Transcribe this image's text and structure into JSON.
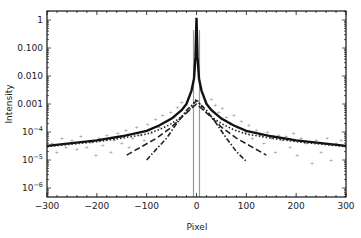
{
  "chart_data": {
    "type": "line",
    "title": "",
    "xlabel": "Pixel",
    "ylabel": "Intensity",
    "xlim": [
      -300,
      300
    ],
    "ylim": [
      4.8e-07,
      2.1
    ],
    "yscale": "log",
    "grid": false,
    "legend": null,
    "x_ticks": [
      -300,
      -200,
      -100,
      0,
      100,
      200,
      300
    ],
    "x_tick_labels": [
      "-300",
      "-200",
      "-100",
      "0",
      "100",
      "200",
      "300"
    ],
    "y_ticks": [
      1,
      0.1,
      0.01,
      0.001,
      0.0001,
      1e-05,
      1e-06
    ],
    "y_tick_labels": [
      "1",
      "0.100",
      "0.010",
      "0.001",
      "10^-4",
      "10^-5",
      "10^-6"
    ],
    "series": [
      {
        "name": "total fit",
        "style": "solid-thick",
        "color": "#111111",
        "x": [
          -300,
          -250,
          -200,
          -150,
          -100,
          -75,
          -50,
          -30,
          -20,
          -10,
          -5,
          -2,
          0,
          2,
          5,
          10,
          20,
          30,
          50,
          75,
          100,
          150,
          200,
          250,
          300
        ],
        "y": [
          3.2e-05,
          4e-05,
          5e-05,
          7e-05,
          0.00011,
          0.00017,
          0.0003,
          0.0006,
          0.001,
          0.003,
          0.008,
          0.05,
          1.2,
          0.05,
          0.008,
          0.003,
          0.001,
          0.0006,
          0.0003,
          0.00017,
          0.00011,
          7e-05,
          5e-05,
          4e-05,
          3.2e-05
        ]
      },
      {
        "name": "component 1 (dotted)",
        "style": "dotted",
        "color": "#222222",
        "x": [
          -300,
          -200,
          -150,
          -100,
          -75,
          -50,
          -30,
          -15,
          0,
          15,
          30,
          50,
          75,
          100,
          150,
          200,
          300
        ],
        "y": [
          3e-05,
          4.5e-05,
          6e-05,
          8.5e-05,
          0.00012,
          0.0002,
          0.00035,
          0.0006,
          0.0015,
          0.0006,
          0.00035,
          0.0002,
          0.00012,
          8.5e-05,
          6e-05,
          4.5e-05,
          3e-05
        ]
      },
      {
        "name": "component 2 (dash-dot)",
        "style": "dash-dot",
        "color": "#222222",
        "x": [
          -100,
          -80,
          -60,
          -40,
          -20,
          0,
          20,
          40,
          60,
          80,
          100
        ],
        "y": [
          1e-05,
          2.5e-05,
          6e-05,
          0.0002,
          0.0006,
          0.0013,
          0.0006,
          0.0002,
          6e-05,
          2e-05,
          9e-06
        ]
      },
      {
        "name": "component 3 (long dash)",
        "style": "long-dash",
        "color": "#222222",
        "x": [
          -140,
          -110,
          -80,
          -50,
          -25,
          0,
          25,
          50,
          80,
          110,
          140
        ],
        "y": [
          1.5e-05,
          3e-05,
          6e-05,
          0.00015,
          0.0004,
          0.001,
          0.0004,
          0.00015,
          6e-05,
          3e-05,
          1.5e-05
        ]
      },
      {
        "name": "data points",
        "style": "scatter",
        "color": "#8a8a8a",
        "x": [
          -290,
          -280,
          -270,
          -262,
          -250,
          -240,
          -232,
          -220,
          -210,
          -202,
          -195,
          -188,
          -180,
          -172,
          -165,
          -158,
          -150,
          -142,
          -135,
          -128,
          -120,
          -112,
          -105,
          -98,
          -90,
          -82,
          -75,
          -68,
          -60,
          -52,
          -45,
          -38,
          -30,
          30,
          38,
          45,
          52,
          60,
          68,
          75,
          82,
          90,
          98,
          105,
          112,
          120,
          128,
          135,
          142,
          150,
          158,
          165,
          172,
          180,
          188,
          195,
          202,
          210,
          220,
          232,
          240,
          250,
          262,
          270,
          280,
          290
        ],
        "y": [
          4e-05,
          2e-05,
          6e-05,
          3e-05,
          5e-05,
          2.5e-05,
          7e-05,
          3e-05,
          4.5e-05,
          1.5e-05,
          6e-05,
          3.5e-05,
          8e-05,
          2e-05,
          5e-05,
          9e-05,
          4e-05,
          0.00012,
          3e-05,
          6e-05,
          0.00015,
          8e-05,
          5e-05,
          0.0002,
          9e-05,
          0.0003,
          0.00015,
          0.0004,
          0.00025,
          0.0005,
          0.00035,
          0.0008,
          0.0012,
          0.0015,
          0.0009,
          0.0005,
          0.0007,
          0.00035,
          0.0002,
          0.0004,
          0.00015,
          0.00025,
          0.0001,
          0.00018,
          6e-05,
          0.00012,
          8e-05,
          4e-05,
          0.0001,
          6e-05,
          2e-05,
          8e-05,
          5e-05,
          7e-05,
          3e-05,
          9e-05,
          1.5e-05,
          6e-05,
          4e-05,
          8e-06,
          5e-05,
          2e-05,
          6e-05,
          1e-05,
          4e-05,
          5e-05
        ]
      },
      {
        "name": "mask boundaries",
        "style": "vertical-lines",
        "color": "#9a9a9a",
        "x": [
          -6,
          6
        ]
      }
    ]
  }
}
